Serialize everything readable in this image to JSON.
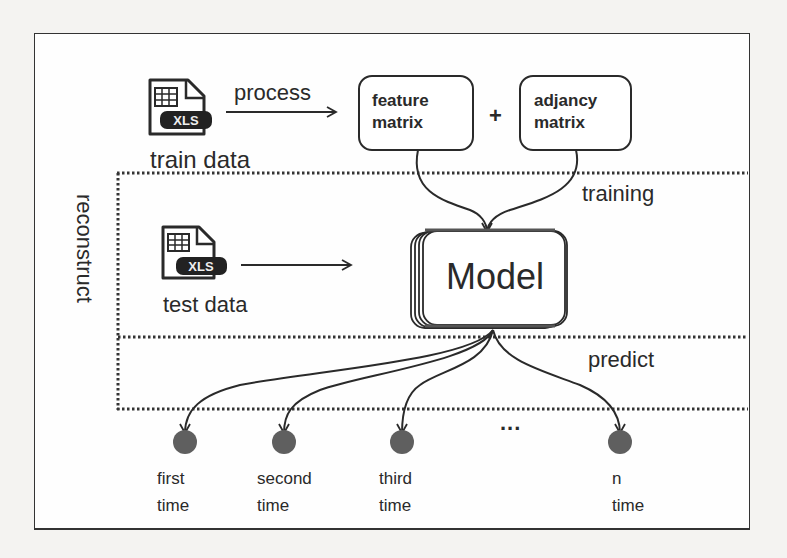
{
  "diagram": {
    "inputs": {
      "train": {
        "icon": "xls-file-icon",
        "badge": "XLS",
        "label": "train data"
      },
      "test": {
        "icon": "xls-file-icon",
        "badge": "XLS",
        "label": "test data"
      }
    },
    "process_label": "process",
    "feature_box": {
      "line1": "feature",
      "line2": "matrix"
    },
    "plus": "+",
    "adjacency_box": {
      "line1": "adjancy",
      "line2": "matrix"
    },
    "model": {
      "label": "Model"
    },
    "regions": {
      "training": "training",
      "predict": "predict",
      "reconstruct": "reconstruct"
    },
    "outputs": [
      {
        "line1": "first",
        "line2": "time"
      },
      {
        "line1": "second",
        "line2": "time"
      },
      {
        "line1": "third",
        "line2": "time"
      },
      {
        "line1": "n",
        "line2": "time"
      }
    ],
    "ellipsis": "...",
    "colors": {
      "stroke": "#2a2a2a",
      "node_fill": "#5f5f5f",
      "background": "#f4f3f1",
      "panel": "#ffffff"
    }
  }
}
